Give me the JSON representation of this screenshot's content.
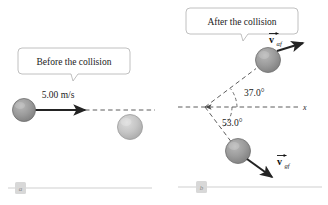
{
  "figure": {
    "background_color": "#ffffff"
  },
  "colors": {
    "sphere_dark_fill": "#9a9a9a",
    "sphere_dark_stroke": "#6f6f6f",
    "sphere_light_fill": "#c4c4c4",
    "sphere_light_stroke": "#9a9a9a",
    "arrow_color": "#232323",
    "dash_color": "#4a4a4a",
    "callout_border": "#b0b0b0",
    "rule_color": "#cfcfcf",
    "panel_box_fill": "#d8d8d8",
    "text_color": "#1a1a1a"
  },
  "panel_a": {
    "letter": "a",
    "callout": {
      "label": "Before the collision"
    },
    "velocity_label": "5.00 m/s",
    "projectile": {
      "name": "alpha-particle",
      "shade": "dark"
    },
    "target": {
      "name": "gold-nucleus",
      "shade": "light"
    },
    "dashed_axis": true
  },
  "panel_b": {
    "letter": "b",
    "callout": {
      "label": "After the collision"
    },
    "axis_label": "x",
    "angles": [
      {
        "name": "alpha-scatter-angle",
        "value": "37.0°",
        "direction": "above-axis",
        "degrees": 37.0
      },
      {
        "name": "gold-recoil-angle",
        "value": "53.0°",
        "direction": "below-axis",
        "degrees": 53.0
      }
    ],
    "vectors": [
      {
        "name": "alpha-final-velocity",
        "symbol": "v",
        "subscript": "αf",
        "direction": "up-right",
        "shade": "dark"
      },
      {
        "name": "gold-final-velocity",
        "symbol": "v",
        "subscript": "gf",
        "direction": "down-right",
        "shade": "dark"
      }
    ]
  }
}
